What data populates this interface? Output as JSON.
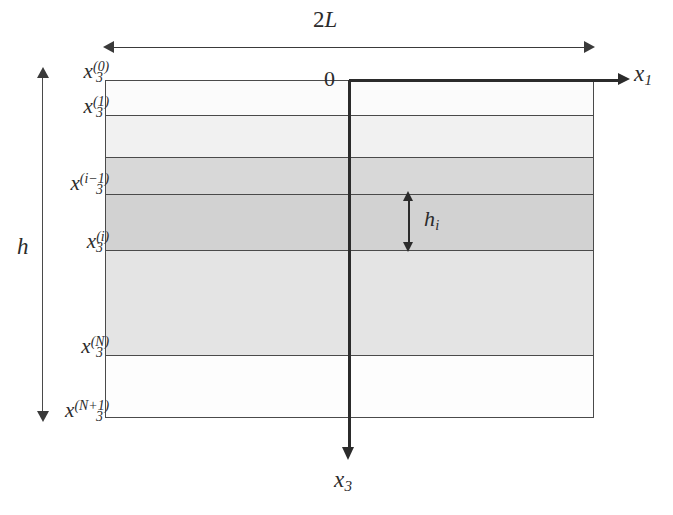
{
  "figure": {
    "kind": "layered-plate-coordinate-diagram",
    "background_color": "#ffffff",
    "line_color": "#2b2b2b",
    "plate": {
      "x_left_px": 105,
      "x_right_px": 594,
      "y_top_px": 80,
      "y_bottom_px": 418
    }
  },
  "labels": {
    "width_dimension": "2L",
    "thickness_dimension": "h",
    "origin": "0",
    "axis_horizontal": {
      "base": "x",
      "sub": "1"
    },
    "axis_vertical": {
      "base": "x",
      "sub": "3"
    },
    "layer_thickness": {
      "base": "h",
      "sub": "i"
    }
  },
  "interfaces": [
    {
      "id": "top",
      "base": "x",
      "sub": "3",
      "sup": "(0)",
      "y_px": 80
    },
    {
      "id": "after-1",
      "base": "x",
      "sub": "3",
      "sup": "(1)",
      "y_px": 115
    },
    {
      "id": "i-minus-1",
      "base": "x",
      "sub": "3",
      "sup": "(i−1)",
      "y_px": 194
    },
    {
      "id": "i",
      "base": "x",
      "sub": "3",
      "sup": "(i)",
      "y_px": 250
    },
    {
      "id": "N",
      "base": "x",
      "sub": "3",
      "sup": "(N)",
      "y_px": 355
    },
    {
      "id": "N-plus-1",
      "base": "x",
      "sub": "3",
      "sup": "(N+1)",
      "y_px": 418
    }
  ],
  "layers": [
    {
      "index": 1,
      "top_px": 80,
      "height_px": 35,
      "fill": "#fbfbfb"
    },
    {
      "index": 2,
      "top_px": 115,
      "height_px": 42,
      "fill": "#f1f1f1"
    },
    {
      "index": 3,
      "top_px": 157,
      "height_px": 37,
      "fill": "#d8d8d8"
    },
    {
      "index": 4,
      "top_px": 194,
      "height_px": 56,
      "fill": "#d2d2d2"
    },
    {
      "index": 5,
      "top_px": 250,
      "height_px": 105,
      "fill": "#e4e4e4"
    },
    {
      "index": 6,
      "top_px": 355,
      "height_px": 63,
      "fill": "#fdfdfd"
    }
  ]
}
